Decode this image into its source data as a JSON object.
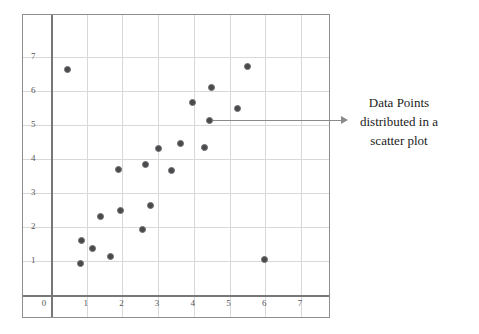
{
  "chart_data": {
    "type": "scatter",
    "title": "",
    "xlabel": "",
    "ylabel": "",
    "xlim": [
      0,
      7.8
    ],
    "ylim": [
      0,
      7.6
    ],
    "grid": true,
    "legend": null,
    "marker": {
      "shape": "circle",
      "fill_color": "#4a4a4d",
      "edge_color": "#6e6e71",
      "size_px": 7
    },
    "x_ticks": [
      "0",
      "1",
      "2",
      "3",
      "4",
      "5",
      "6",
      "7"
    ],
    "y_ticks": [
      "1",
      "2",
      "3",
      "4",
      "5",
      "6",
      "7"
    ],
    "x_tick_values": [
      0,
      1,
      2,
      3,
      4,
      5,
      6,
      7
    ],
    "y_tick_values": [
      1,
      2,
      3,
      4,
      5,
      6,
      7
    ],
    "points": [
      {
        "x": 0.45,
        "y": 6.62
      },
      {
        "x": 0.82,
        "y": 0.92
      },
      {
        "x": 0.85,
        "y": 1.6
      },
      {
        "x": 1.15,
        "y": 1.38
      },
      {
        "x": 1.4,
        "y": 2.32
      },
      {
        "x": 1.67,
        "y": 1.12
      },
      {
        "x": 1.9,
        "y": 3.68
      },
      {
        "x": 1.95,
        "y": 2.48
      },
      {
        "x": 2.55,
        "y": 1.92
      },
      {
        "x": 2.65,
        "y": 3.83
      },
      {
        "x": 2.78,
        "y": 2.64
      },
      {
        "x": 3.02,
        "y": 4.32
      },
      {
        "x": 3.38,
        "y": 3.65
      },
      {
        "x": 3.62,
        "y": 4.45
      },
      {
        "x": 3.95,
        "y": 5.65
      },
      {
        "x": 4.3,
        "y": 4.33
      },
      {
        "x": 4.45,
        "y": 5.12
      },
      {
        "x": 4.5,
        "y": 6.1
      },
      {
        "x": 5.22,
        "y": 5.5
      },
      {
        "x": 5.5,
        "y": 6.72
      },
      {
        "x": 5.98,
        "y": 1.05
      }
    ],
    "annotation": {
      "lines": [
        "Data Points",
        "distributed in a",
        "scatter plot"
      ],
      "pointer_from": {
        "x": 4.45,
        "y": 5.12
      },
      "arrow": true
    }
  },
  "colors": {
    "frame": "#8e8e8e",
    "axis": "#777777",
    "grid": "#d8d8d8",
    "marker": "#4a4a4d",
    "text": "#1b1b1b",
    "tick_text": "#58585a",
    "background": "#ffffff"
  }
}
